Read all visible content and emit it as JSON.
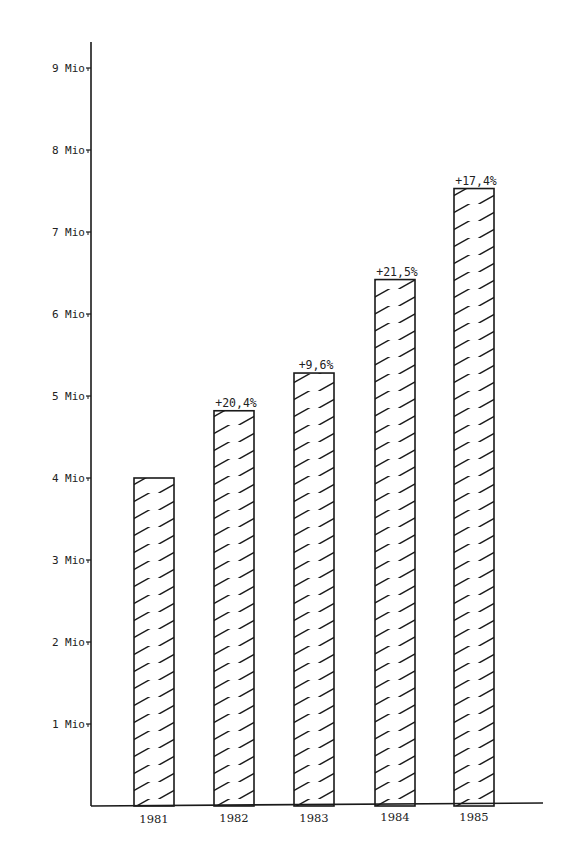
{
  "chart_data": {
    "type": "bar",
    "title": "",
    "xlabel": "",
    "ylabel": "",
    "categories": [
      "1981",
      "1982",
      "1983",
      "1984",
      "1985"
    ],
    "values": [
      4.0,
      4.82,
      5.28,
      6.42,
      7.53
    ],
    "unit": "Mio",
    "growth_labels": [
      "",
      "+20,4%",
      "+9,6%",
      "+21,5%",
      "+17,4%"
    ],
    "ylim": [
      0,
      9
    ],
    "yticks": [
      1,
      2,
      3,
      4,
      5,
      6,
      7,
      8,
      9
    ],
    "ytick_labels": [
      "1 Mio",
      "2 Mio",
      "3 Mio",
      "4 Mio",
      "5 Mio",
      "6 Mio",
      "7 Mio",
      "8 Mio",
      "9 Mio"
    ],
    "grid": false,
    "legend": null,
    "fill_pattern": "diagonal-hatch",
    "colors": {
      "ink": "#1a1a1a",
      "background": "#ffffff"
    }
  }
}
